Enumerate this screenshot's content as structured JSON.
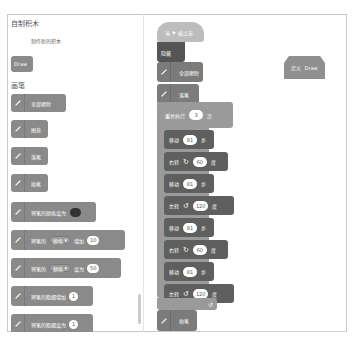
{
  "palette": {
    "categories": [
      {
        "title": "自制积木",
        "make_button": "制作新的积木",
        "blocks": [
          {
            "label": "Draw"
          }
        ]
      },
      {
        "title": "画笔"
      }
    ],
    "pen_blocks": [
      {
        "label": "全部擦除"
      },
      {
        "label": "图章"
      },
      {
        "label": "落笔"
      },
      {
        "label": "抬笔"
      },
      {
        "label": "将笔的颜色设为",
        "color": "#333333"
      },
      {
        "label_a": "将笔的",
        "dropdown": "颜色",
        "label_b": "增加",
        "value": "10"
      },
      {
        "label_a": "将笔的",
        "dropdown": "颜色",
        "label_b": "设为",
        "value": "50"
      },
      {
        "label": "将笔的粗细增加",
        "value": "1"
      },
      {
        "label": "将笔的粗细设为",
        "value": "1"
      }
    ]
  },
  "script": {
    "hat_label": "当 ⚑ 被点击",
    "define_label": "隐藏",
    "blocks": [
      {
        "label": "全部擦除"
      },
      {
        "label": "落笔"
      }
    ],
    "repeat": {
      "label_a": "重复执行",
      "value": "3",
      "label_b": "次"
    },
    "inner": [
      {
        "label": "移动",
        "value": "81",
        "unit": "步"
      },
      {
        "label": "右转",
        "icon": "↻",
        "value": "60",
        "unit": "度"
      },
      {
        "label": "移动",
        "value": "81",
        "unit": "步"
      },
      {
        "label": "左转",
        "icon": "↺",
        "value": "120",
        "unit": "度"
      },
      {
        "label": "移动",
        "value": "81",
        "unit": "步"
      },
      {
        "label": "右转",
        "icon": "↻",
        "value": "60",
        "unit": "度"
      },
      {
        "label": "移动",
        "value": "81",
        "unit": "步"
      },
      {
        "label": "左转",
        "icon": "↺",
        "value": "120",
        "unit": "度"
      }
    ],
    "loop_arrow": "↺",
    "after": {
      "label": "抬笔"
    }
  },
  "define_block": {
    "label_a": "定义",
    "label_b": "Draw"
  }
}
